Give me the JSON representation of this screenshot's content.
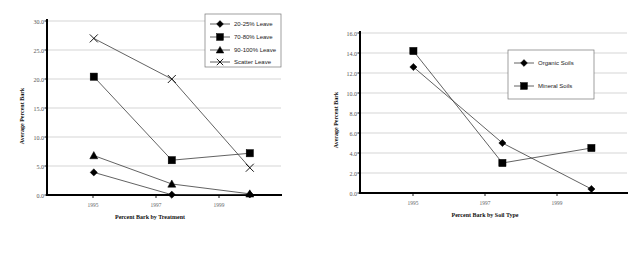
{
  "figure": {
    "panels": [
      "left-chart",
      "right-chart"
    ],
    "background_color": "#ffffff",
    "marker_color": "#000000",
    "line_color": "#3a3a3a",
    "grid_color": "#b9b9b9"
  },
  "left": {
    "ylabel": "Average Percent Bark",
    "xlabel": "Percent Bark by Treatment",
    "yticks": [
      "0.0",
      "5.0",
      "10.0",
      "15.0",
      "20.0",
      "25.0",
      "30.0"
    ],
    "xticks": [
      "1995",
      "1997",
      "1999"
    ],
    "legend": [
      {
        "label": "20-25% Leave",
        "marker": "diamond"
      },
      {
        "label": "70-80% Leave",
        "marker": "square"
      },
      {
        "label": "90-100% Leave",
        "marker": "triangle"
      },
      {
        "label": "Scatter Leave",
        "marker": "x"
      }
    ]
  },
  "right": {
    "ylabel": "Average Percent Bark",
    "xlabel": "Percent Bark by Soil Type",
    "yticks": [
      "0.0",
      "2.0",
      "4.0",
      "6.0",
      "8.0",
      "10.0",
      "12.0",
      "14.0",
      "16.0"
    ],
    "xticks": [
      "1995",
      "1997",
      "1999"
    ],
    "legend": [
      {
        "label": "Organic Soils",
        "marker": "diamond"
      },
      {
        "label": "Mineral Soils",
        "marker": "square"
      }
    ]
  },
  "chart_data": [
    {
      "type": "line",
      "id": "percent-bark-by-treatment",
      "title": "",
      "xlabel": "Percent Bark by Treatment",
      "ylabel": "Average Percent Bark",
      "ylim": [
        0.0,
        30.0
      ],
      "ytick_step": 5.0,
      "ytick_labels": [
        "0.0",
        "5.0",
        "10.0",
        "15.0",
        "20.0",
        "25.0",
        "30.0"
      ],
      "xlim": [
        1994.0,
        2001.5
      ],
      "xtick_labels": [
        "1995",
        "1997",
        "1999"
      ],
      "xtick_values": [
        1995,
        1997,
        1999
      ],
      "x": [
        1995.5,
        1998.0,
        2000.5
      ],
      "grid": "horizontal",
      "legend_position": "top-right",
      "series": [
        {
          "name": "20-25% Leave",
          "marker": "diamond",
          "values": [
            3.9,
            0.05,
            0.1
          ]
        },
        {
          "name": "70-80% Leave",
          "marker": "square",
          "values": [
            20.4,
            6.0,
            7.2
          ]
        },
        {
          "name": "90-100% Leave",
          "marker": "triangle",
          "values": [
            6.8,
            1.9,
            0.2
          ]
        },
        {
          "name": "Scatter Leave",
          "marker": "x",
          "values": [
            27.0,
            20.0,
            4.7
          ]
        }
      ]
    },
    {
      "type": "line",
      "id": "percent-bark-by-soil-type",
      "title": "",
      "xlabel": "Percent Bark by Soil Type",
      "ylabel": "Average Percent Bark",
      "ylim": [
        0.0,
        16.0
      ],
      "ytick_step": 2.0,
      "ytick_labels": [
        "0.0",
        "2.0",
        "4.0",
        "6.0",
        "8.0",
        "10.0",
        "12.0",
        "14.0",
        "16.0"
      ],
      "xlim": [
        1994.0,
        2001.5
      ],
      "xtick_labels": [
        "1995",
        "1997",
        "1999"
      ],
      "xtick_values": [
        1995,
        1997,
        1999
      ],
      "x": [
        1995.5,
        1998.0,
        2000.5
      ],
      "grid": "horizontal",
      "legend_position": "upper-center-right",
      "series": [
        {
          "name": "Organic Soils",
          "marker": "diamond",
          "values": [
            12.6,
            5.0,
            0.4
          ]
        },
        {
          "name": "Mineral Soils",
          "marker": "square",
          "values": [
            14.2,
            3.0,
            4.5
          ]
        }
      ]
    }
  ]
}
